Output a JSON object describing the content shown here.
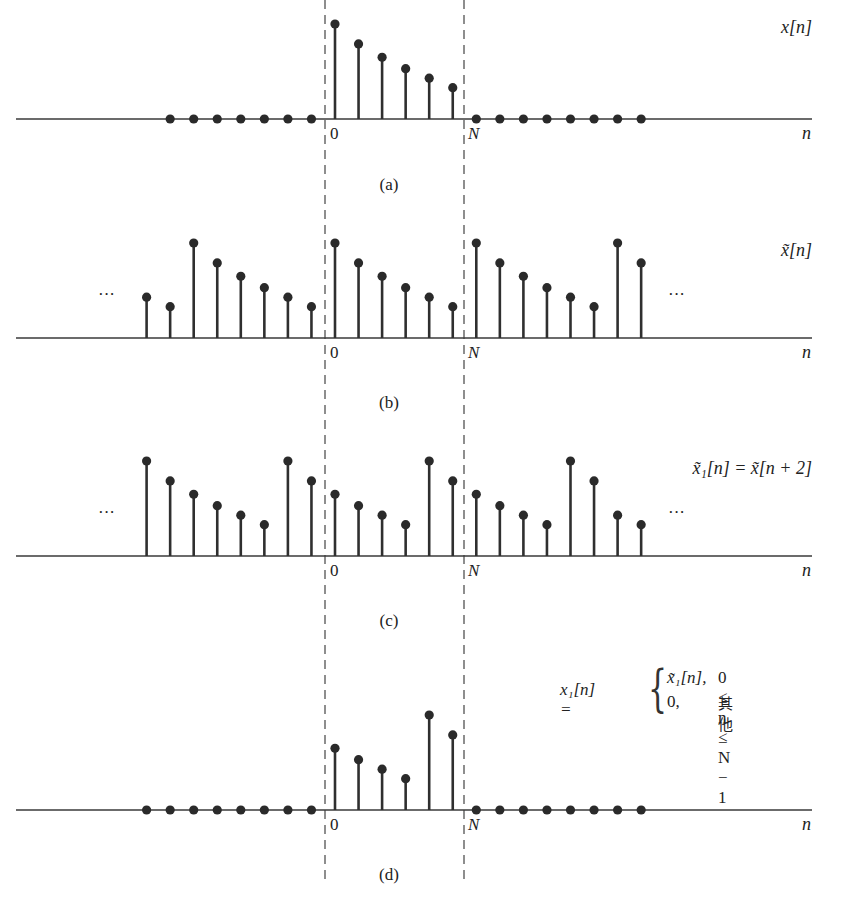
{
  "figure": {
    "period_label": "N",
    "origin_label": "0",
    "axis_label": "n",
    "ellipsis": "···"
  },
  "chart_data": [
    {
      "id": "a",
      "type": "stem",
      "caption": "(a)",
      "signal_label": "x[n]",
      "n": [
        -7,
        -6,
        -5,
        -4,
        -3,
        -2,
        -1,
        0,
        1,
        2,
        3,
        4,
        5,
        6,
        7,
        8,
        9,
        10,
        11,
        12,
        13
      ],
      "values": [
        0,
        0,
        0,
        0,
        0,
        0,
        0,
        1.0,
        0.79,
        0.65,
        0.53,
        0.43,
        0.33,
        0,
        0,
        0,
        0,
        0,
        0,
        0,
        0
      ],
      "xlabel": "n",
      "tick_labels": [
        "0",
        "N"
      ],
      "ellipsis_left": false,
      "ellipsis_right": false
    },
    {
      "id": "b",
      "type": "stem",
      "caption": "(b)",
      "signal_label": "x̃[n]",
      "n": [
        -8,
        -7,
        -6,
        -5,
        -4,
        -3,
        -2,
        -1,
        0,
        1,
        2,
        3,
        4,
        5,
        6,
        7,
        8,
        9,
        10,
        11,
        12,
        13
      ],
      "values": [
        0.43,
        0.33,
        1.0,
        0.79,
        0.65,
        0.53,
        0.43,
        0.33,
        1.0,
        0.79,
        0.65,
        0.53,
        0.43,
        0.33,
        1.0,
        0.79,
        0.65,
        0.53,
        0.43,
        0.33,
        1.0,
        0.79
      ],
      "xlabel": "n",
      "tick_labels": [
        "0",
        "N"
      ],
      "ellipsis_left": true,
      "ellipsis_right": true
    },
    {
      "id": "c",
      "type": "stem",
      "caption": "(c)",
      "signal_label": "x̃₁[n] = x̃[n + 2]",
      "n": [
        -8,
        -7,
        -6,
        -5,
        -4,
        -3,
        -2,
        -1,
        0,
        1,
        2,
        3,
        4,
        5,
        6,
        7,
        8,
        9,
        10,
        11,
        12,
        13
      ],
      "values": [
        1.0,
        0.79,
        0.65,
        0.53,
        0.43,
        0.33,
        1.0,
        0.79,
        0.65,
        0.53,
        0.43,
        0.33,
        1.0,
        0.79,
        0.65,
        0.53,
        0.43,
        0.33,
        1.0,
        0.79,
        0.43,
        0.33
      ],
      "xlabel": "n",
      "tick_labels": [
        "0",
        "N"
      ],
      "ellipsis_left": true,
      "ellipsis_right": true
    },
    {
      "id": "d",
      "type": "stem",
      "caption": "(d)",
      "signal_label": "x₁[n]",
      "n": [
        -8,
        -7,
        -6,
        -5,
        -4,
        -3,
        -2,
        -1,
        0,
        1,
        2,
        3,
        4,
        5,
        6,
        7,
        8,
        9,
        10,
        11,
        12,
        13
      ],
      "values": [
        0,
        0,
        0,
        0,
        0,
        0,
        0,
        0,
        0.65,
        0.53,
        0.43,
        0.33,
        1.0,
        0.79,
        0,
        0,
        0,
        0,
        0,
        0,
        0,
        0
      ],
      "xlabel": "n",
      "tick_labels": [
        "0",
        "N"
      ],
      "ellipsis_left": false,
      "ellipsis_right": false
    }
  ],
  "piecewise": {
    "lhs": "x₁[n] =",
    "case1_value": "x̃₁[n],",
    "case1_condition": "0 ≤ n ≤ N − 1",
    "case2_value": "0,",
    "case2_condition": "其他",
    "brace": "{"
  }
}
